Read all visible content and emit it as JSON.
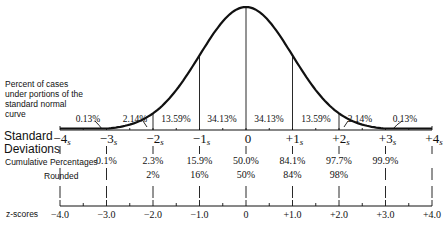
{
  "chart_data": {
    "type": "area",
    "curve_label": "Percent of cases under portions of the standard normal curve",
    "segments": [
      {
        "from": -4,
        "to": -3,
        "label": "0.13%"
      },
      {
        "from": -3,
        "to": -2,
        "label": "2.14%"
      },
      {
        "from": -2,
        "to": -1,
        "label": "13.59%"
      },
      {
        "from": -1,
        "to": 0,
        "label": "34.13%"
      },
      {
        "from": 0,
        "to": 1,
        "label": "34.13%"
      },
      {
        "from": 1,
        "to": 2,
        "label": "13.59%"
      },
      {
        "from": 2,
        "to": 3,
        "label": "2.14%"
      },
      {
        "from": 3,
        "to": 4,
        "label": "0.13%"
      }
    ],
    "standard_deviations": {
      "label_line1": "Standard",
      "label_line2": "Deviations",
      "ticks": [
        "-4",
        "-3",
        "-2",
        "-1",
        "0",
        "+1",
        "+2",
        "+3",
        "+4"
      ],
      "subscript": "s"
    },
    "cumulative_percentages": {
      "label": "Cumulative Percentages",
      "values": [
        "",
        "0.1%",
        "2.3%",
        "15.9%",
        "50.0%",
        "84.1%",
        "97.7%",
        "99.9%",
        ""
      ]
    },
    "rounded": {
      "label": "Rounded",
      "values": [
        "",
        "",
        "2%",
        "16%",
        "50%",
        "84%",
        "98%",
        "",
        ""
      ]
    },
    "z_scores": {
      "label": "z-scores",
      "ticks": [
        "-4.0",
        "-3.0",
        "-2.0",
        "-1.0",
        "0",
        "+1.0",
        "+2.0",
        "+3.0",
        "+4.0"
      ]
    },
    "xlim": [
      -4,
      4
    ]
  }
}
